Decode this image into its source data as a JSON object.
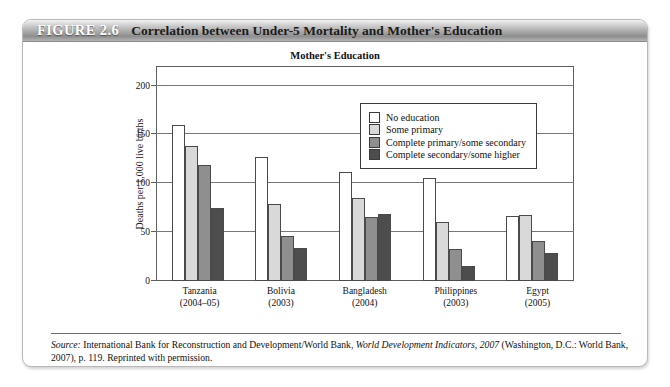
{
  "figure": {
    "number_label": "FIGURE 2.6",
    "title": "Correlation between Under-5 Mortality and Mother's Education"
  },
  "source": {
    "label": "Source:",
    "text_part1": " International Bank for Reconstruction and Development/World Bank, ",
    "italic_title": "World Development Indicators, 2007",
    "text_part2": " (Washington, D.C.: World Bank, 2007), p. 119. Reprinted with permission."
  },
  "legend": {
    "items": [
      {
        "label": "No education",
        "color": "#ffffff"
      },
      {
        "label": "Some primary",
        "color": "#d9d9d9"
      },
      {
        "label": "Complete primary/some secondary",
        "color": "#8f8f8f"
      },
      {
        "label": "Complete secondary/some higher",
        "color": "#4d4d4d"
      }
    ]
  },
  "chart_data": {
    "type": "bar",
    "title": "Mother's Education",
    "xlabel": "",
    "ylabel": "Deaths per 1,000 live births",
    "ylim": [
      0,
      220
    ],
    "yticks": [
      0,
      50,
      100,
      150,
      200
    ],
    "ytick_labels": [
      "0",
      "50",
      "100",
      "150",
      "200"
    ],
    "grid": true,
    "legend_position": "upper-right-inside",
    "categories": [
      "Tanzania",
      "Bolivia",
      "Bangladesh",
      "Philippines",
      "Egypt"
    ],
    "category_sublabels": [
      "(2004–05)",
      "(2003)",
      "(2004)",
      "(2003)",
      "(2005)"
    ],
    "series": [
      {
        "name": "No education",
        "values": [
          160,
          127,
          112,
          105,
          67
        ]
      },
      {
        "name": "Some primary",
        "values": [
          138,
          79,
          85,
          60,
          68
        ]
      },
      {
        "name": "Complete primary/some secondary",
        "values": [
          119,
          46,
          66,
          33,
          41
        ]
      },
      {
        "name": "Complete secondary/some higher",
        "values": [
          75,
          34,
          69,
          15,
          29
        ]
      }
    ]
  }
}
